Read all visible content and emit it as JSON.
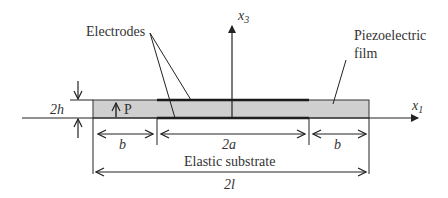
{
  "labels": {
    "electrodes": "Electrodes",
    "piezo_line1": "Piezoelectric",
    "piezo_line2": "film",
    "x3": "x",
    "x3_sub": "3",
    "x1": "x",
    "x1_sub": "1",
    "thickness": "2h",
    "polarization": "P",
    "b_left": "b",
    "b_right": "b",
    "electrode_width": "2a",
    "substrate": "Elastic substrate",
    "total_length": "2l"
  },
  "colors": {
    "film_fill": "#cfcfcf",
    "line": "#222222",
    "electrode": "#1a1a1a"
  }
}
